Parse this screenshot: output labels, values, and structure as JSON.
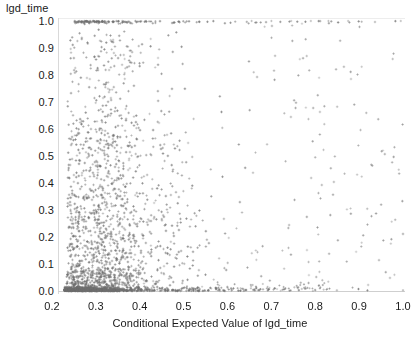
{
  "chart_data": {
    "type": "scatter",
    "title": "",
    "ylabel": "lgd_time",
    "xlabel": "Conditional Expected Value of lgd_time",
    "xlim": [
      0.2,
      1.0
    ],
    "ylim": [
      0.0,
      1.0
    ],
    "xticks": [
      "0.2",
      "0.3",
      "0.4",
      "0.5",
      "0.6",
      "0.7",
      "0.8",
      "0.9",
      "1.0"
    ],
    "xtick_values": [
      0.2,
      0.3,
      0.4,
      0.5,
      0.6,
      0.7,
      0.8,
      0.9,
      1.0
    ],
    "yticks": [
      "0.0",
      "0.1",
      "0.2",
      "0.3",
      "0.4",
      "0.5",
      "0.6",
      "0.7",
      "0.8",
      "0.9",
      "1.0"
    ],
    "ytick_values": [
      0.0,
      0.1,
      0.2,
      0.3,
      0.4,
      0.5,
      0.6,
      0.7,
      0.8,
      0.9,
      1.0
    ],
    "grid": false,
    "legend": null,
    "marker": "plus",
    "marker_color": "#707070",
    "marker_size": 2,
    "n_points": 2100,
    "clusters": [
      {
        "name": "zero-floor",
        "x_range": [
          0.225,
          0.62
        ],
        "y": 0.0,
        "count": 700,
        "note": "very dense line of points at y=0"
      },
      {
        "name": "one-ceiling",
        "x_range": [
          0.23,
          1.0
        ],
        "y": 1.0,
        "count": 190,
        "note": "saturated band at y=1, dense to x=0.6 then sparse"
      },
      {
        "name": "interior-bulk",
        "x_range": [
          0.23,
          0.62
        ],
        "y_range": [
          0.01,
          0.99
        ],
        "count": 1050,
        "note": "diffuse cloud, density decays upward"
      },
      {
        "name": "right-tail",
        "x_range": [
          0.62,
          1.0
        ],
        "y_range": [
          0.0,
          1.0
        ],
        "count": 160,
        "note": "sparse scattered points"
      }
    ]
  },
  "axes": {
    "y_title": "lgd_time",
    "x_title": "Conditional Expected Value of lgd_time"
  },
  "colors": {
    "marker": "#707070",
    "axis": "#cfcfcf",
    "text": "#1a1a1a",
    "background": "#ffffff"
  }
}
